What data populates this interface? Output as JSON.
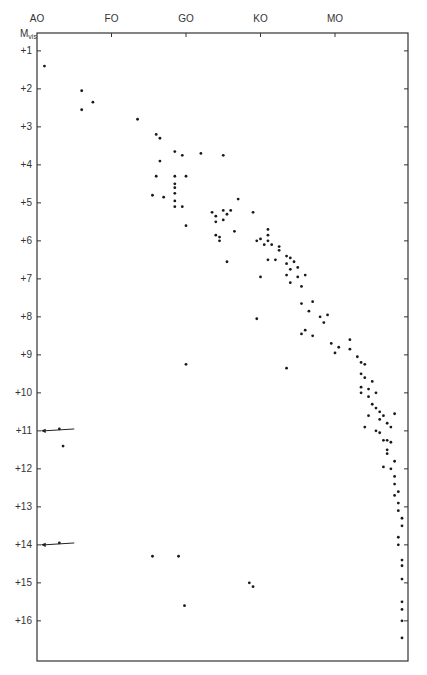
{
  "chart_data": {
    "type": "scatter",
    "title": "",
    "xlabel": "Spectral type",
    "ylabel": "M_vis",
    "ylabel_sub": "vis",
    "x_categories": [
      "AO",
      "FO",
      "GO",
      "KO",
      "MO"
    ],
    "x_scale_note": "A0=0, F0=1, G0=2, K0=3, M0=4",
    "xlim": [
      0,
      4.95
    ],
    "ylim": [
      0.5,
      17.0
    ],
    "y_inverted": true,
    "y_ticks": [
      "+1",
      "+2",
      "+3",
      "+4",
      "+5",
      "+6",
      "+7",
      "+8",
      "+9",
      "+10",
      "+11",
      "+12",
      "+13",
      "+14",
      "+15",
      "+16"
    ],
    "grid": false,
    "legend": null,
    "annotations": [
      {
        "type": "arrow",
        "from": [
          0.5,
          10.95
        ],
        "to": [
          0.05,
          11.0
        ]
      },
      {
        "type": "arrow",
        "from": [
          0.5,
          13.95
        ],
        "to": [
          0.05,
          14.0
        ]
      }
    ],
    "series": [
      {
        "name": "main_sequence",
        "points": [
          [
            0.1,
            1.4
          ],
          [
            0.6,
            2.05
          ],
          [
            0.6,
            2.55
          ],
          [
            0.75,
            2.35
          ],
          [
            1.35,
            2.8
          ],
          [
            1.6,
            3.2
          ],
          [
            1.65,
            3.3
          ],
          [
            1.85,
            3.65
          ],
          [
            1.65,
            3.9
          ],
          [
            1.95,
            3.75
          ],
          [
            1.6,
            4.3
          ],
          [
            1.85,
            4.3
          ],
          [
            2.0,
            4.3
          ],
          [
            1.55,
            4.8
          ],
          [
            1.7,
            4.85
          ],
          [
            1.85,
            4.95
          ],
          [
            1.85,
            5.1
          ],
          [
            1.95,
            5.1
          ],
          [
            1.85,
            4.5
          ],
          [
            1.85,
            4.6
          ],
          [
            1.85,
            4.75
          ],
          [
            2.0,
            5.6
          ],
          [
            2.35,
            5.25
          ],
          [
            2.4,
            5.5
          ],
          [
            2.4,
            5.35
          ],
          [
            2.5,
            5.2
          ],
          [
            2.5,
            5.45
          ],
          [
            2.55,
            5.3
          ],
          [
            2.65,
            5.75
          ],
          [
            2.6,
            5.2
          ],
          [
            2.45,
            5.9
          ],
          [
            2.45,
            6.0
          ],
          [
            2.55,
            6.55
          ],
          [
            2.7,
            4.9
          ],
          [
            2.9,
            5.25
          ],
          [
            2.4,
            5.85
          ],
          [
            3.0,
            5.95
          ],
          [
            3.1,
            5.7
          ],
          [
            3.1,
            5.85
          ],
          [
            3.1,
            6.0
          ],
          [
            3.05,
            6.1
          ],
          [
            2.95,
            6.0
          ],
          [
            3.15,
            6.1
          ],
          [
            3.25,
            6.15
          ],
          [
            3.25,
            6.25
          ],
          [
            3.2,
            6.5
          ],
          [
            3.1,
            6.5
          ],
          [
            3.35,
            6.4
          ],
          [
            3.35,
            6.6
          ],
          [
            3.4,
            6.45
          ],
          [
            3.45,
            6.55
          ],
          [
            3.35,
            6.9
          ],
          [
            3.5,
            6.7
          ],
          [
            3.4,
            6.75
          ],
          [
            3.5,
            6.95
          ],
          [
            3.6,
            6.9
          ],
          [
            3.4,
            7.1
          ],
          [
            3.0,
            6.95
          ],
          [
            3.55,
            7.2
          ],
          [
            3.55,
            7.65
          ],
          [
            3.65,
            7.85
          ],
          [
            3.7,
            7.6
          ],
          [
            3.8,
            8.0
          ],
          [
            3.85,
            8.15
          ],
          [
            3.9,
            7.95
          ],
          [
            3.55,
            8.45
          ],
          [
            3.7,
            8.5
          ],
          [
            3.6,
            8.35
          ],
          [
            3.95,
            8.7
          ],
          [
            4.0,
            8.95
          ],
          [
            4.05,
            8.8
          ],
          [
            4.2,
            8.6
          ],
          [
            4.2,
            8.85
          ],
          [
            4.3,
            9.05
          ],
          [
            4.35,
            9.2
          ],
          [
            4.4,
            9.25
          ],
          [
            4.35,
            9.5
          ],
          [
            4.4,
            9.6
          ],
          [
            4.45,
            9.9
          ],
          [
            4.45,
            10.1
          ],
          [
            4.5,
            10.3
          ],
          [
            4.35,
            9.85
          ],
          [
            4.35,
            10.0
          ],
          [
            4.5,
            9.7
          ],
          [
            4.55,
            10.0
          ],
          [
            4.55,
            10.4
          ],
          [
            4.6,
            10.5
          ],
          [
            4.6,
            10.7
          ],
          [
            4.65,
            10.6
          ],
          [
            4.7,
            10.8
          ],
          [
            4.75,
            10.9
          ],
          [
            4.8,
            10.55
          ],
          [
            4.45,
            10.6
          ],
          [
            4.4,
            10.9
          ],
          [
            4.55,
            11.0
          ],
          [
            4.6,
            11.05
          ],
          [
            4.65,
            11.25
          ],
          [
            4.7,
            11.25
          ],
          [
            4.75,
            11.3
          ],
          [
            4.7,
            11.5
          ],
          [
            4.7,
            11.6
          ],
          [
            4.65,
            11.95
          ],
          [
            4.8,
            11.8
          ],
          [
            4.75,
            12.0
          ],
          [
            4.8,
            12.2
          ],
          [
            4.8,
            12.4
          ],
          [
            4.85,
            12.6
          ],
          [
            4.8,
            12.7
          ],
          [
            4.85,
            12.9
          ],
          [
            4.85,
            13.1
          ],
          [
            4.9,
            13.3
          ],
          [
            4.9,
            13.5
          ],
          [
            4.85,
            13.8
          ],
          [
            4.85,
            14.0
          ],
          [
            4.95,
            14.4
          ],
          [
            4.95,
            14.55
          ],
          [
            4.9,
            14.9
          ],
          [
            4.98,
            15.5
          ],
          [
            4.98,
            15.7
          ],
          [
            5.02,
            16.0
          ],
          [
            5.0,
            16.45
          ]
        ]
      },
      {
        "name": "subgiants_giants",
        "points": [
          [
            2.2,
            3.7
          ],
          [
            2.5,
            3.75
          ]
        ]
      },
      {
        "name": "white_dwarfs_and_outliers",
        "points": [
          [
            0.3,
            10.95
          ],
          [
            0.35,
            11.4
          ],
          [
            0.3,
            13.95
          ],
          [
            1.55,
            14.3
          ],
          [
            1.9,
            14.3
          ],
          [
            1.98,
            15.6
          ],
          [
            2.9,
            15.1
          ],
          [
            2.85,
            15.0
          ],
          [
            2.95,
            8.05
          ],
          [
            3.35,
            9.35
          ],
          [
            2.0,
            9.25
          ]
        ]
      }
    ]
  },
  "axis": {
    "y_title": "M",
    "y_title_sub": "vis"
  }
}
